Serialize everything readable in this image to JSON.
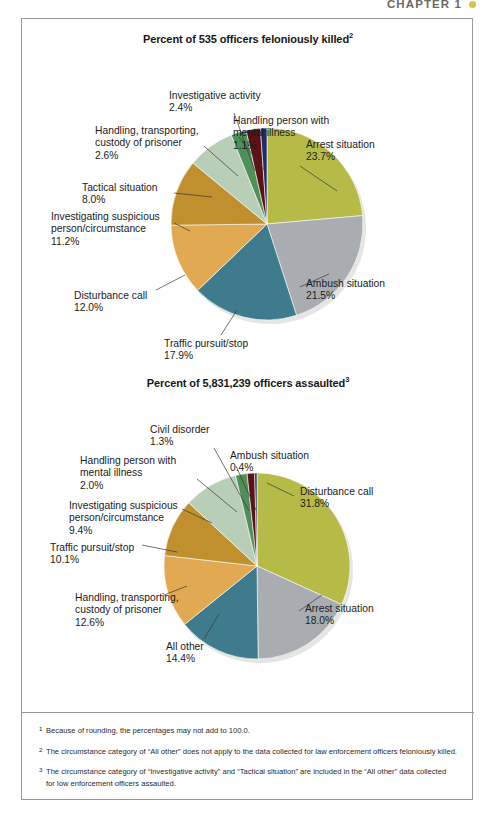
{
  "running_head": {
    "text": "CHAPTER 1",
    "marker_color": "#d8c24a"
  },
  "palette": {
    "olive": "#b5bb46",
    "gray": "#a9adb2",
    "teal": "#3e7b8c",
    "light_orange": "#e0a952",
    "dark_gold": "#c08f2e",
    "sage": "#b9ceb6",
    "green": "#4e9158",
    "dark_red": "#5e1113",
    "navy": "#1d2b66"
  },
  "chart_data": [
    {
      "type": "pie",
      "id": "officers-feloniously-killed",
      "title": "Percent of 535 officers feloniously killed",
      "title_superscript": "2",
      "total_label": "535 officers",
      "legend_position": "callout-labels",
      "categories": [
        "Arrest situation",
        "Ambush situation",
        "Traffic pursuit/stop",
        "Disturbance call",
        "Investigating suspicious person/circumstance",
        "Tactical situation",
        "Handling, transporting, custody of prisoner",
        "Investigative activity",
        "Handling person with mental illness"
      ],
      "values": [
        23.7,
        21.5,
        17.9,
        12.0,
        11.2,
        8.0,
        2.6,
        2.4,
        1.1
      ],
      "value_labels": [
        "23.7%",
        "21.5%",
        "17.9%",
        "12.0%",
        "11.2%",
        "8.0%",
        "2.6%",
        "2.4%",
        "1.1%"
      ],
      "colors": [
        "#b5bb46",
        "#a9adb2",
        "#3e7b8c",
        "#e0a952",
        "#c08f2e",
        "#b9ceb6",
        "#4e9158",
        "#5e1113",
        "#1d2b66"
      ],
      "labels": [
        {
          "name": "Arrest situation",
          "value": "23.7%",
          "lines": [
            "Arrest situation",
            "23.7%"
          ]
        },
        {
          "name": "Ambush situation",
          "value": "21.5%",
          "lines": [
            "Ambush situation",
            "21.5%"
          ]
        },
        {
          "name": "Traffic pursuit/stop",
          "value": "17.9%",
          "lines": [
            "Traffic pursuit/stop",
            "17.9%"
          ]
        },
        {
          "name": "Disturbance call",
          "value": "12.0%",
          "lines": [
            "Disturbance call",
            "12.0%"
          ]
        },
        {
          "name": "Investigating suspicious person/circumstance",
          "value": "11.2%",
          "lines": [
            "Investigating suspicious",
            "person/circumstance",
            "11.2%"
          ]
        },
        {
          "name": "Tactical situation",
          "value": "8.0%",
          "lines": [
            "Tactical situation",
            "8.0%"
          ]
        },
        {
          "name": "Handling, transporting, custody of prisoner",
          "value": "2.6%",
          "lines": [
            "Handling, transporting,",
            "custody of prisoner",
            "2.6%"
          ]
        },
        {
          "name": "Investigative activity",
          "value": "2.4%",
          "lines": [
            "Investigative activity",
            "2.4%"
          ]
        },
        {
          "name": "Handling person with mental illness",
          "value": "1.1%",
          "lines": [
            "Handling person with",
            "mental illness",
            "1.1%"
          ]
        }
      ]
    },
    {
      "type": "pie",
      "id": "officers-assaulted",
      "title": "Percent of 5,831,239 officers assaulted",
      "title_superscript": "3",
      "total_label": "5,831,239 officers",
      "legend_position": "callout-labels",
      "categories": [
        "Disturbance call",
        "Arrest situation",
        "All other",
        "Handling, transporting, custody of prisoner",
        "Traffic pursuit/stop",
        "Investigating suspicious person/circumstance",
        "Handling person with mental illness",
        "Civil disorder",
        "Ambush situation"
      ],
      "values": [
        31.8,
        18.0,
        14.4,
        12.6,
        10.1,
        9.4,
        2.0,
        1.3,
        0.4
      ],
      "value_labels": [
        "31.8%",
        "18.0%",
        "14.4%",
        "12.6%",
        "10.1%",
        "9.4%",
        "2.0%",
        "1.3%",
        "0.4%"
      ],
      "colors": [
        "#b5bb46",
        "#a9adb2",
        "#3e7b8c",
        "#e0a952",
        "#c08f2e",
        "#b9ceb6",
        "#4e9158",
        "#5e1113",
        "#1d2b66"
      ],
      "labels": [
        {
          "name": "Disturbance call",
          "value": "31.8%",
          "lines": [
            "Disturbance call",
            "31.8%"
          ]
        },
        {
          "name": "Arrest situation",
          "value": "18.0%",
          "lines": [
            "Arrest situation",
            "18.0%"
          ]
        },
        {
          "name": "All other",
          "value": "14.4%",
          "lines": [
            "All other",
            "14.4%"
          ]
        },
        {
          "name": "Handling, transporting, custody of prisoner",
          "value": "12.6%",
          "lines": [
            "Handling, transporting,",
            "custody of prisoner",
            "12.6%"
          ]
        },
        {
          "name": "Traffic pursuit/stop",
          "value": "10.1%",
          "lines": [
            "Traffic pursuit/stop",
            "10.1%"
          ]
        },
        {
          "name": "Investigating suspicious person/circumstance",
          "value": "9.4%",
          "lines": [
            "Investigating suspicious",
            "person/circumstance",
            "9.4%"
          ]
        },
        {
          "name": "Handling person with mental illness",
          "value": "2.0%",
          "lines": [
            "Handling person with",
            "mental illness",
            "2.0%"
          ]
        },
        {
          "name": "Civil disorder",
          "value": "1.3%",
          "lines": [
            "Civil disorder",
            "1.3%"
          ]
        },
        {
          "name": "Ambush situation",
          "value": "0.4%",
          "lines": [
            "Ambush situation",
            "0.4%"
          ]
        }
      ]
    }
  ],
  "footnotes": [
    {
      "mark": "1",
      "text": "Because of rounding, the percentages may not add to 100.0."
    },
    {
      "mark": "2",
      "text": "The circumstance category of “All other” does not apply to the data collected for law enforcement officers feloniously killed."
    },
    {
      "mark": "3",
      "text": "The circumstance category of “Investigative activity” and “Tactical situation” are included in the “All other” data collected for low enforcement officers assaulted."
    }
  ]
}
